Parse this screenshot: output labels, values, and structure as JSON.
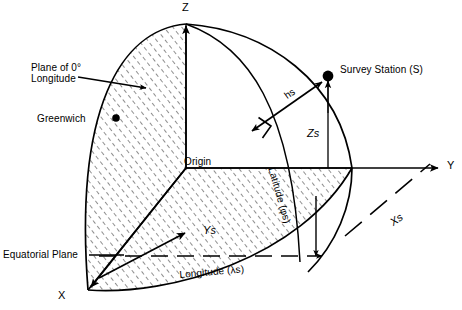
{
  "figure": {
    "background_color": "#ffffff",
    "line_color": "#000000",
    "hatch_color": "#333333"
  },
  "axes": {
    "z_label": "Z",
    "y_label": "Y",
    "x_label": "X",
    "origin_label": "Origin"
  },
  "annotations": {
    "plane_of_zero_longitude_line1": "Plane of 0°",
    "plane_of_zero_longitude_line2": "Longitude",
    "greenwich": "Greenwich",
    "equatorial_plane": "Equatorial Plane",
    "survey_station_prefix": "Survey Station (",
    "survey_station_symbol": "S",
    "survey_station_suffix": ")",
    "height_label": "hs",
    "z_component": "Zs",
    "y_component": "Ys",
    "x_component": "Xs",
    "latitude_prefix": "Latitude (",
    "latitude_symbol": "φs",
    "latitude_suffix": ")",
    "longitude_prefix": "Longitude (",
    "longitude_symbol": "λs",
    "longitude_suffix": ")"
  },
  "geometry": {
    "origin_px": [
      186,
      168
    ],
    "z_axis_top_px": [
      186,
      24
    ],
    "y_axis_end_px": [
      441,
      168
    ],
    "x_axis_end_px": [
      88,
      290
    ],
    "survey_station_px": [
      328,
      76
    ],
    "greenwich_dot_px": [
      116,
      118
    ],
    "sphere_radius_px": 150
  }
}
